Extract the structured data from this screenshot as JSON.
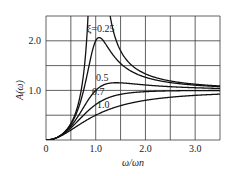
{
  "chart_data": {
    "type": "line",
    "title": "",
    "xlabel": "ω/ωn",
    "ylabel": "A(ω)",
    "xlim": [
      0,
      3.5
    ],
    "ylim": [
      0,
      2.5
    ],
    "grid": true,
    "x_ticks": [
      0,
      0.5,
      1.0,
      1.5,
      2.0,
      2.5,
      3.0,
      3.5
    ],
    "x_tick_labels": [
      "0",
      "1.0",
      "2.0",
      "3.0"
    ],
    "x_tick_label_positions": [
      0,
      1.0,
      2.0,
      3.0
    ],
    "y_ticks": [
      0,
      0.5,
      1.0,
      1.5,
      2.0,
      2.5
    ],
    "y_tick_labels": [
      "1.0",
      "2.0"
    ],
    "y_tick_label_positions": [
      1.0,
      2.0
    ],
    "formula": "A = r^2 / sqrt((1-r^2)^2 + (2*xi*r)^2)",
    "series": [
      {
        "name": "ξ=0",
        "xi": 0.0,
        "label": "",
        "x": [
          0,
          0.25,
          0.5,
          0.7,
          0.8,
          0.84,
          1.3,
          1.5,
          2.0,
          2.5,
          3.0,
          3.5
        ],
        "values": [
          0,
          0.07,
          0.33,
          0.96,
          1.78,
          2.4,
          2.45,
          1.8,
          1.33,
          1.19,
          1.13,
          1.09
        ]
      },
      {
        "name": "ξ=0.25",
        "xi": 0.25,
        "label": "ξ=0.25",
        "x": [
          0,
          0.25,
          0.5,
          0.75,
          1.0,
          1.07,
          1.25,
          1.5,
          2.0,
          2.5,
          3.0,
          3.5
        ],
        "values": [
          0,
          0.07,
          0.31,
          0.83,
          2.0,
          2.07,
          1.6,
          1.3,
          1.19,
          1.12,
          1.09,
          1.07
        ]
      },
      {
        "name": "ξ=0.5",
        "xi": 0.5,
        "label": "0.5",
        "x": [
          0,
          0.25,
          0.5,
          0.75,
          1.0,
          1.41,
          2.0,
          2.5,
          3.0,
          3.5
        ],
        "values": [
          0,
          0.06,
          0.28,
          0.62,
          1.0,
          1.15,
          1.11,
          1.07,
          1.05,
          1.04
        ]
      },
      {
        "name": "ξ=0.7",
        "xi": 0.7,
        "label": "0.7",
        "x": [
          0,
          0.25,
          0.5,
          0.75,
          1.0,
          1.5,
          2.0,
          2.5,
          3.0,
          3.5
        ],
        "values": [
          0,
          0.06,
          0.24,
          0.5,
          0.71,
          0.93,
          0.99,
          1.0,
          1.0,
          1.0
        ]
      },
      {
        "name": "ξ=1.0",
        "xi": 1.0,
        "label": "1.0",
        "x": [
          0,
          0.25,
          0.5,
          0.75,
          1.0,
          1.5,
          2.0,
          2.5,
          3.0,
          3.5
        ],
        "values": [
          0,
          0.06,
          0.2,
          0.36,
          0.5,
          0.69,
          0.8,
          0.86,
          0.9,
          0.92
        ]
      }
    ],
    "annotations": [
      {
        "text": "ξ=0.25",
        "x": 1.1,
        "y": 2.17
      },
      {
        "text": "0.5",
        "x": 1.13,
        "y": 1.18
      },
      {
        "text": "0.7",
        "x": 1.05,
        "y": 0.9
      },
      {
        "text": "1.0",
        "x": 1.15,
        "y": 0.64
      }
    ]
  }
}
